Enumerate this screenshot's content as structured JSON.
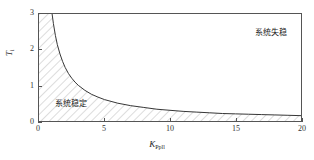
{
  "chart_data": {
    "type": "line",
    "title": "",
    "xlabel": "K",
    "xlabel_sub": "Ppll",
    "ylabel": "T",
    "ylabel_sub": "i",
    "xlim": [
      0,
      20
    ],
    "ylim": [
      0,
      3
    ],
    "xticks": [
      0,
      5,
      10,
      15,
      20
    ],
    "xticklabels": [
      "0",
      "5",
      "10",
      "15",
      "20"
    ],
    "yticks": [
      0,
      1,
      2,
      3
    ],
    "yticklabels": [
      "0",
      "1",
      "2",
      "3"
    ],
    "grid": false,
    "legend": null,
    "series": [
      {
        "name": "stability-boundary",
        "description": "hyperbolic stability boundary T_i = 3 / K_Ppll",
        "color": "#333333",
        "x": [
          1.0,
          1.1,
          1.25,
          1.4,
          1.6,
          1.8,
          2.0,
          2.25,
          2.5,
          2.75,
          3.0,
          3.5,
          4.0,
          4.5,
          5.0,
          5.5,
          6.0,
          7.0,
          8.0,
          9.0,
          10.0,
          11.0,
          12.0,
          13.0,
          14.0,
          15.0,
          16.0,
          17.0,
          18.0,
          19.0,
          20.0
        ],
        "y": [
          3.0,
          2.73,
          2.4,
          2.14,
          1.88,
          1.67,
          1.5,
          1.33,
          1.2,
          1.09,
          1.0,
          0.86,
          0.75,
          0.67,
          0.6,
          0.55,
          0.5,
          0.43,
          0.38,
          0.33,
          0.3,
          0.27,
          0.25,
          0.23,
          0.21,
          0.2,
          0.19,
          0.18,
          0.17,
          0.16,
          0.15
        ]
      }
    ],
    "regions": [
      {
        "name": "stable-region",
        "label": "系统稳定",
        "fill": "hatch",
        "hatch_color": "#9a9a9a",
        "label_x": 2.2,
        "label_y": 0.45
      },
      {
        "name": "unstable-region",
        "label": "系统失稳",
        "fill": "none",
        "label_x": 17.0,
        "label_y": 2.6
      }
    ],
    "annotations": [
      {
        "name": "annotation-unstable",
        "text": "系统失稳"
      },
      {
        "name": "annotation-stable",
        "text": "系统稳定"
      }
    ],
    "axis_color": "#555555",
    "background": "#ffffff"
  }
}
